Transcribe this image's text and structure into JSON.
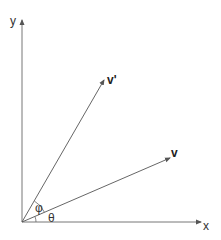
{
  "diagram": {
    "title": "",
    "origin": {
      "x": 22,
      "y": 222
    },
    "axes": {
      "x": {
        "label": "x",
        "end": {
          "x": 202,
          "y": 222
        }
      },
      "y": {
        "label": "y",
        "end": {
          "x": 22,
          "y": 19
        }
      }
    },
    "vectors": [
      {
        "name": "v_prime",
        "label": "v'",
        "end": {
          "x": 104,
          "y": 80
        }
      },
      {
        "name": "v",
        "label": "v",
        "end": {
          "x": 170,
          "y": 158
        }
      }
    ],
    "angles": [
      {
        "name": "phi",
        "label": "φ",
        "between": [
          "v",
          "v_prime"
        ]
      },
      {
        "name": "theta",
        "label": "θ",
        "between": [
          "x_axis",
          "v"
        ]
      }
    ],
    "colors": {
      "line": "#555555",
      "text": "#333333",
      "background": "#ffffff"
    }
  }
}
